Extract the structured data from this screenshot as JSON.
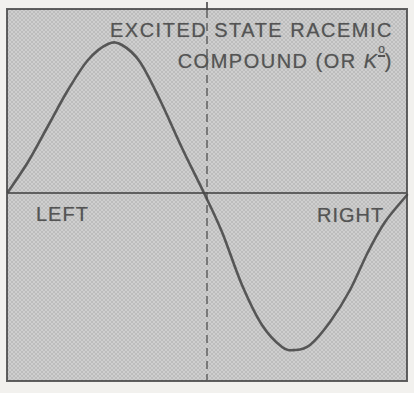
{
  "figure": {
    "title_line1": "EXCITED STATE RACEMIC",
    "title_line2_prefix": "COMPOUND (OR ",
    "k_symbol": "K",
    "k_superscript": "o",
    "title_line2_suffix": ")",
    "label_left": "LEFT",
    "label_right": "RIGHT"
  },
  "colors": {
    "paper": "#f2f1ee",
    "ht_light": "#cfcfcf",
    "ht_dark": "#bdbdbd",
    "ink": "#474747",
    "text": "#545454"
  },
  "chart_data": {
    "type": "line",
    "xlabel": "",
    "ylabel": "",
    "x_region_labels": [
      "LEFT",
      "RIGHT"
    ],
    "x_axis_ticks": [],
    "y_axis_ticks": [],
    "grid": false,
    "legend": "none",
    "baseline": "horizontal zero line across middle of plot",
    "centerline": "vertical dashed line at horizontal center, small tick above top border",
    "series": [
      {
        "name": "anomalous-dispersion curve (positive lobe left, negative lobe right)",
        "x_frac": [
          0,
          0.05,
          0.1,
          0.15,
          0.2,
          0.25,
          0.29,
          0.33,
          0.38,
          0.44,
          0.49,
          0.54,
          0.59,
          0.64,
          0.69,
          0.72,
          0.76,
          0.81,
          0.86,
          0.9,
          0.95,
          1.0
        ],
        "y_rel": [
          0.01,
          0.21,
          0.45,
          0.69,
          0.89,
          0.99,
          0.99,
          0.87,
          0.62,
          0.3,
          0.0,
          -0.26,
          -0.61,
          -0.88,
          -1.03,
          -1.05,
          -1.01,
          -0.86,
          -0.65,
          -0.39,
          -0.19,
          -0.01
        ]
      }
    ],
    "curve_px": [
      [
        8,
        192
      ],
      [
        28,
        162
      ],
      [
        48,
        126
      ],
      [
        68,
        90
      ],
      [
        88,
        60
      ],
      [
        108,
        44
      ],
      [
        122,
        45
      ],
      [
        140,
        62
      ],
      [
        160,
        100
      ],
      [
        182,
        148
      ],
      [
        204,
        193
      ],
      [
        222,
        232
      ],
      [
        242,
        285
      ],
      [
        262,
        325
      ],
      [
        282,
        347
      ],
      [
        295,
        350
      ],
      [
        310,
        345
      ],
      [
        330,
        322
      ],
      [
        350,
        290
      ],
      [
        368,
        252
      ],
      [
        385,
        222
      ],
      [
        407,
        195
      ]
    ],
    "axis_y_px": 193,
    "dashed_x_px": 207,
    "top_tick_y_px": 2,
    "plot_box_px": {
      "left": 8,
      "top": 10,
      "right": 406,
      "bottom": 380
    }
  }
}
